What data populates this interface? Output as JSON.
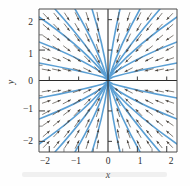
{
  "figure": {
    "name": "direction-field-plot",
    "background_color": "#fefefe"
  },
  "chart_data": {
    "type": "scatter",
    "subtype": "direction-field-with-solution-curves",
    "title": "",
    "subtitle": "",
    "xlabel": "x",
    "ylabel": "y",
    "xlim": [
      -2.35,
      2.35
    ],
    "ylim": [
      -2.35,
      2.35
    ],
    "grid": false,
    "legend": null,
    "x_ticks": [
      -2,
      -1,
      0,
      1,
      2
    ],
    "x_tick_labels": [
      "−2",
      "−1",
      "0",
      "1",
      "2"
    ],
    "y_ticks": [
      -2,
      -1,
      0,
      1,
      2
    ],
    "y_tick_labels": [
      "−2",
      "−1",
      "0",
      "1",
      "2"
    ],
    "x_minor_ticks": [
      -1.5,
      -0.5,
      0.5,
      1.5
    ],
    "y_minor_ticks": [
      -1.5,
      -0.5,
      0.5,
      1.5
    ],
    "equilibrium_point": [
      0,
      0
    ],
    "equilibrium_type": "stable node (sink)",
    "flow_direction": "all arrows point toward the origin",
    "curve_color": "#5a9fd4",
    "arrow_color": "#5b554f",
    "axis_color": "#2a2a2a",
    "vector_field": {
      "description": "slope field arrows on a grid, each arrow directed toward the origin",
      "grid_x": [
        -2.1,
        -1.75,
        -1.4,
        -1.05,
        -0.7,
        -0.35,
        0.35,
        0.7,
        1.05,
        1.4,
        1.75,
        2.1
      ],
      "grid_y": [
        -2.1,
        -1.75,
        -1.4,
        -1.05,
        -0.7,
        -0.35,
        0.35,
        0.7,
        1.05,
        1.4,
        1.75,
        2.1
      ],
      "arrow_length": 0.26
    },
    "solution_curves": {
      "family": "curves through the origin, tangent to the vertical axis near 0",
      "count": 24,
      "slopes": [
        0.18,
        0.38,
        0.62,
        0.95,
        1.45,
        2.2,
        3.6,
        7.0
      ]
    },
    "series": [
      {
        "name": "solution curves",
        "color": "#5a9fd4",
        "values": []
      },
      {
        "name": "direction field arrows",
        "color": "#5b554f",
        "values": []
      }
    ]
  },
  "axes": {
    "x_axis_label": "x",
    "y_axis_label": "y"
  }
}
